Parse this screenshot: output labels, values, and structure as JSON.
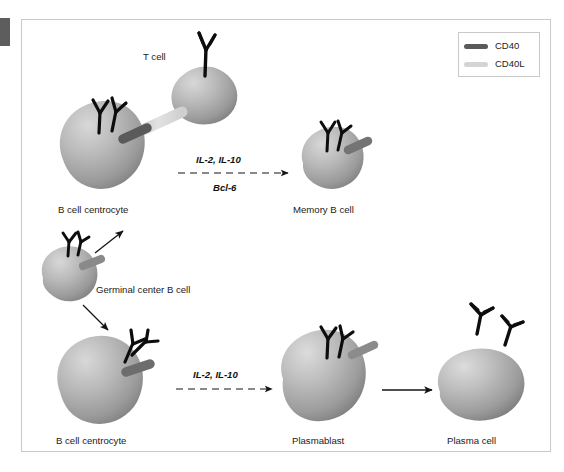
{
  "figure": {
    "background": "#ffffff",
    "panel_border": "#c9c9c9"
  },
  "legend": {
    "items": [
      {
        "label": "CD40",
        "color": "#5a5a5a",
        "icon": "line-swatch-icon"
      },
      {
        "label": "CD40L",
        "color": "#d4d4d4",
        "icon": "line-swatch-icon"
      }
    ]
  },
  "cells": [
    {
      "id": "t-cell",
      "label": "T cell",
      "shape": "blob",
      "receptors": "tcr-y-shape",
      "ligand": "CD40L"
    },
    {
      "id": "b-cell-centrocyte-top",
      "label": "B cell centrocyte",
      "shape": "blob",
      "receptors": "bcr-y-shape",
      "ligand": "CD40"
    },
    {
      "id": "memory-b-cell",
      "label": "Memory B cell",
      "shape": "round",
      "receptors": "bcr-y-shape",
      "ligand": "CD40"
    },
    {
      "id": "germinal-center-b-cell",
      "label": "Germinal center B cell",
      "shape": "round",
      "receptors": "bcr-y-shape",
      "ligand": "CD40"
    },
    {
      "id": "b-cell-centrocyte-bottom",
      "label": "B cell centrocyte",
      "shape": "blob",
      "receptors": "bcr-y-shape",
      "ligand": "CD40"
    },
    {
      "id": "plasmablast",
      "label": "Plasmablast",
      "shape": "teardrop",
      "receptors": "bcr-y-shape",
      "ligand": "CD40"
    },
    {
      "id": "plasma-cell",
      "label": "Plasma cell",
      "shape": "oval",
      "receptors": "secreted-antibodies",
      "ligand": "none"
    }
  ],
  "arrows": [
    {
      "id": "arrow-memory",
      "style": "dashed",
      "label_above": "IL-2, IL-10",
      "label_below": "Bcl-6",
      "from": "b-cell-centrocyte-top",
      "to": "memory-b-cell"
    },
    {
      "id": "arrow-plasmablast",
      "style": "dashed",
      "label_above": "IL-2, IL-10",
      "label_below": "",
      "from": "b-cell-centrocyte-bottom",
      "to": "plasmablast"
    },
    {
      "id": "arrow-plasma-cell",
      "style": "solid",
      "label_above": "",
      "label_below": "",
      "from": "plasmablast",
      "to": "plasma-cell"
    },
    {
      "id": "arrow-gc-up",
      "style": "solid",
      "label_above": "",
      "label_below": "",
      "from": "germinal-center-b-cell",
      "to": "b-cell-centrocyte-top"
    },
    {
      "id": "arrow-gc-down",
      "style": "solid",
      "label_above": "",
      "label_below": "",
      "from": "germinal-center-b-cell",
      "to": "b-cell-centrocyte-bottom"
    }
  ],
  "colors": {
    "cell_light": "#cfcfcf",
    "cell_mid": "#a8a8a8",
    "cell_dark": "#7e7e7e",
    "receptor": "#0d0d0d",
    "cd40": "#5a5a5a",
    "cd40l": "#d6d6d6",
    "arrow": "#141414",
    "text": "#1b1b1b"
  }
}
